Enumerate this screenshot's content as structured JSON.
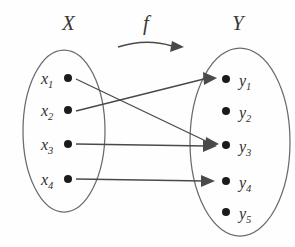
{
  "figure": {
    "background_color": "#fefefe",
    "stroke_color": "#4a4a4a",
    "ellipse_color": "#6a6a6a",
    "dot_color": "#1b1b1b"
  },
  "domain_set": {
    "label": "X",
    "label_x": 62,
    "label_y": 30,
    "ellipse": {
      "cx": 64,
      "cy": 131,
      "rx": 41,
      "ry": 81
    },
    "elements": [
      {
        "id": "x1",
        "base": "x",
        "sub": "1",
        "dot_x": 68,
        "dot_y": 78,
        "label_x": 41,
        "label_y": 84
      },
      {
        "id": "x2",
        "base": "x",
        "sub": "2",
        "dot_x": 68,
        "dot_y": 110,
        "label_x": 41,
        "label_y": 116
      },
      {
        "id": "x3",
        "base": "x",
        "sub": "3",
        "dot_x": 68,
        "dot_y": 144,
        "label_x": 41,
        "label_y": 150
      },
      {
        "id": "x4",
        "base": "x",
        "sub": "4",
        "dot_x": 68,
        "dot_y": 179,
        "label_x": 41,
        "label_y": 185
      }
    ]
  },
  "codomain_set": {
    "label": "Y",
    "label_x": 232,
    "label_y": 30,
    "ellipse": {
      "cx": 240,
      "cy": 142,
      "rx": 50,
      "ry": 94
    },
    "elements": [
      {
        "id": "y1",
        "base": "y",
        "sub": "1",
        "dot_x": 226,
        "dot_y": 79,
        "label_x": 239,
        "label_y": 86
      },
      {
        "id": "y2",
        "base": "y",
        "sub": "2",
        "dot_x": 226,
        "dot_y": 111,
        "label_x": 239,
        "label_y": 118
      },
      {
        "id": "y3",
        "base": "y",
        "sub": "3",
        "dot_x": 226,
        "dot_y": 145,
        "label_x": 239,
        "label_y": 152
      },
      {
        "id": "y4",
        "base": "y",
        "sub": "4",
        "dot_x": 226,
        "dot_y": 181,
        "label_x": 239,
        "label_y": 188
      },
      {
        "id": "y5",
        "base": "y",
        "sub": "5",
        "dot_x": 226,
        "dot_y": 212,
        "label_x": 239,
        "label_y": 219
      }
    ]
  },
  "function": {
    "label": "f",
    "label_x": 143,
    "label_y": 30,
    "curve_path": "M 118 47 Q 146 38 172 46",
    "arrowhead": "M 172 41 L 184 47 L 170 52 Z"
  },
  "mappings": [
    {
      "id": "x1-to-y3",
      "from": "x1",
      "to": "y3",
      "x1": 76,
      "y1": 79,
      "x2": 210,
      "y2": 143,
      "head": "M 206 137 L 219 144 L 205 150 Z"
    },
    {
      "id": "x2-to-y1",
      "from": "x2",
      "to": "y1",
      "x1": 76,
      "y1": 111,
      "x2": 208,
      "y2": 78,
      "head": "M 203 72 L 217 78 L 204 85 Z"
    },
    {
      "id": "x3-to-y3",
      "from": "x3",
      "to": "y3",
      "x1": 76,
      "y1": 144,
      "x2": 207,
      "y2": 146,
      "head": "M 203 140 L 217 146 L 203 152 Z"
    },
    {
      "id": "x4-to-y4",
      "from": "x4",
      "to": "y4",
      "x1": 76,
      "y1": 179,
      "x2": 205,
      "y2": 181,
      "head": "M 201 175 L 215 181 L 201 187 Z"
    }
  ]
}
